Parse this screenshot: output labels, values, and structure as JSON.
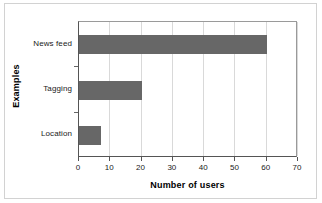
{
  "chart_data": {
    "type": "bar",
    "orientation": "horizontal",
    "title": "",
    "xlabel": "Number of users",
    "ylabel": "Examples",
    "categories": [
      "News feed",
      "Tagging",
      "Location"
    ],
    "values": [
      60,
      20,
      7
    ],
    "series": [
      {
        "name": "Number of users",
        "values": [
          60,
          20,
          7
        ]
      }
    ],
    "xlim": [
      0,
      70
    ],
    "xticks": [
      0,
      10,
      20,
      30,
      40,
      50,
      60,
      70
    ],
    "xtick_labels": [
      "0",
      "10",
      "20",
      "30",
      "40",
      "50",
      "60",
      "70"
    ],
    "grid": "vertical",
    "legend": "none",
    "bar_color": "#676767",
    "gridline_color": "#d9d9d9",
    "axis_color": "#555555",
    "background_color": "#ffffff"
  }
}
